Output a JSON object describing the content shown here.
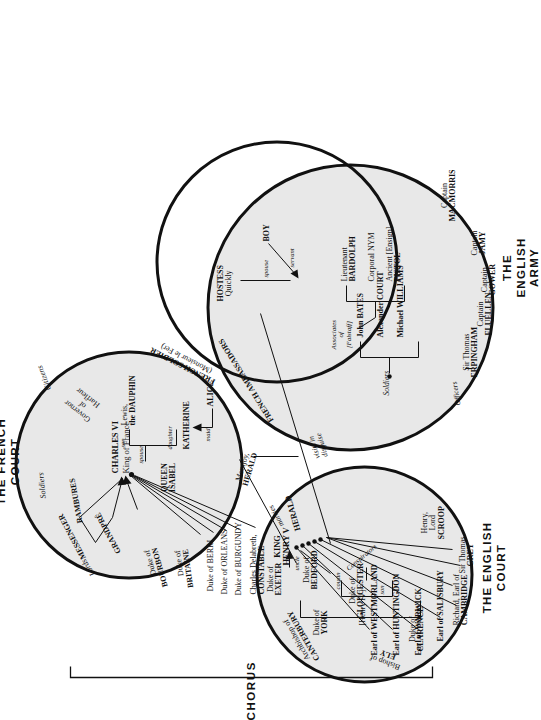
{
  "diagram": {
    "chorus_label": "CHORUS",
    "groups": [
      {
        "id": "french-court",
        "title_line1": "THE FRENCH",
        "title_line2": "COURT"
      },
      {
        "id": "english-court",
        "title_line1": "THE ENGLISH",
        "title_line2": "COURT"
      },
      {
        "id": "english-army",
        "title_line1": "THE",
        "title_line2": "ENGLISH",
        "title_line3": "ARMY"
      }
    ]
  },
  "french_court": {
    "king": {
      "name": "CHARLES VI",
      "role": "King of France"
    },
    "queen_line1": "QUEEN",
    "queen_line2": "ISABEL",
    "dauphin_line1": "Lewis,",
    "dauphin_line2": "the DAUPHIN",
    "katherine": "KATHERINE",
    "alice": "ALICE",
    "rel_spouse": "spouse",
    "rel_son": "son",
    "rel_daughter": "daughter",
    "rel_maid": "maid",
    "lords_label": "Lords",
    "soldiers_label": "Soldiers",
    "lords": [
      "MESSENGER",
      "GRANDPRÉ",
      "RAMBURES"
    ],
    "dukes": [
      {
        "line1": "Duke of",
        "line2": "BOURBON"
      },
      {
        "line1": "Duke of",
        "line2": "BRITAINE"
      },
      {
        "line1": "Duke of BERRI",
        "line2": ""
      },
      {
        "line1": "Duke of ORLEANS",
        "line2": ""
      },
      {
        "line1": "Duke of BURGUNDY",
        "line2": ""
      }
    ],
    "constable_line1": "Charles Delabreth,",
    "constable_line2": "CONSTABLE",
    "herald_line1": "Montjoy,",
    "herald_line2": "HERALD",
    "ambassadors": "FRENCH AMBASSADORS",
    "french_soldier_line1": "FRENCH SOLDIER",
    "french_soldier_line2": "(Monsieur le Fer)",
    "governor_line1": "Governor",
    "governor_line2": "of",
    "governor_line3": "Harfleur",
    "citizens": "Citizens"
  },
  "english_court": {
    "king_line1": "KING",
    "king_line2": "HENRY V",
    "herald": "HERALD",
    "archbishop_line1": "Archbishop of",
    "archbishop_line2": "CANTERBURY",
    "bishop_line1": "Bishop of",
    "bishop_line2": "ELY",
    "henry_iv": "[Henry IV]",
    "rel_son": "son",
    "rel_cousin": "cousin",
    "rel_uncle": "uncle",
    "exeter_line1": "Duke of",
    "exeter_line2": "EXETER",
    "york_line1": "Duke of",
    "york_line2": "YORK",
    "brothers": [
      {
        "line1": "Duke of",
        "line2": "CLARENCE"
      },
      {
        "line1": "Duke of",
        "line2": "GLOUCESTER"
      },
      {
        "line1": "Duke of",
        "line2": "BEDFORD"
      }
    ],
    "nobles": [
      "Earl of WESTMORLAND",
      "Earl of HUNTINGDON",
      "Earl of WARWICK",
      "Earl of SALISBURY"
    ],
    "conspirators_label": "Conspirators",
    "conspirators": [
      {
        "line1": "Richard, Earl of",
        "line2": "CAMBRIDGE"
      },
      {
        "line1": "Sir Thomas",
        "line2": "GREY"
      },
      {
        "line1": "Henry,",
        "line2": "Lord",
        "line3": "SCROOP"
      }
    ]
  },
  "english_army": {
    "officers_label": "Officers",
    "officers": [
      {
        "line1": "Sir Thomas",
        "line2": "ERPINGHAM"
      },
      {
        "line1": "Captain",
        "line2": "FLUELLEN"
      },
      {
        "line1": "Captain",
        "line2": "GOWER"
      },
      {
        "line1": "Captain",
        "line2": "JAMY"
      },
      {
        "line1": "Captain",
        "line2": "MACMORRIS"
      }
    ],
    "soldiers_label": "Soldiers",
    "soldiers": [
      "John BATES",
      "Alexander COURT",
      "Michael WILLIAMS"
    ],
    "associates_line1": "Associates",
    "associates_line2": "of",
    "associates_line3": "[Falstaff]",
    "associates": [
      {
        "line1": "Lieutenant",
        "line2": "BARDOLPH"
      },
      {
        "line1": "Corporal NYM",
        "line2": ""
      },
      {
        "line1": "Ancient [Ensign]",
        "line2": "PISTOL"
      }
    ],
    "hostess_line1": "HOSTESS",
    "hostess_line2": "Quickly",
    "boy": "BOY",
    "rel_spouse": "spouse",
    "rel_servant": "servant"
  },
  "connections": {
    "marries": "marries",
    "visits_line1": "visits in",
    "visits_line2": "disguise"
  }
}
